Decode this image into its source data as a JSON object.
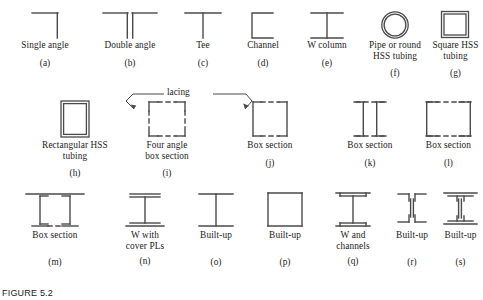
{
  "figure": {
    "caption": "FIGURE 5.2",
    "annotation": {
      "lacing_label": "lacing"
    },
    "stroke_color": "#4a4a4a",
    "text_color": "#1a1a1a"
  },
  "rows": [
    {
      "id": "row-1",
      "items": [
        {
          "tag": "(a)",
          "label": "Single angle",
          "shape": "single-angle"
        },
        {
          "tag": "(b)",
          "label": "Double angle",
          "shape": "double-angle"
        },
        {
          "tag": "(c)",
          "label": "Tee",
          "shape": "tee"
        },
        {
          "tag": "(d)",
          "label": "Channel",
          "shape": "channel"
        },
        {
          "tag": "(e)",
          "label": "W column",
          "shape": "w-column"
        },
        {
          "tag": "(f)",
          "label": "Pipe or round\nHSS tubing",
          "shape": "pipe-round-hss"
        },
        {
          "tag": "(g)",
          "label": "Square HSS\ntubing",
          "shape": "square-hss"
        }
      ]
    },
    {
      "id": "row-2",
      "items": [
        {
          "tag": "(h)",
          "label": "Rectangular HSS\ntubing",
          "shape": "rectangular-hss"
        },
        {
          "tag": "(i)",
          "label": "Four angle\nbox section",
          "shape": "four-angle-box"
        },
        {
          "tag": "(j)",
          "label": "Box section",
          "shape": "box-section-j"
        },
        {
          "tag": "(k)",
          "label": "Box section",
          "shape": "box-section-k"
        },
        {
          "tag": "(l)",
          "label": "Box section",
          "shape": "box-section-l"
        }
      ]
    },
    {
      "id": "row-3",
      "items": [
        {
          "tag": "(m)",
          "label": "Box section",
          "shape": "box-section-m"
        },
        {
          "tag": "(n)",
          "label": "W with\ncover PLs",
          "shape": "w-cover-plates"
        },
        {
          "tag": "(o)",
          "label": "Built-up",
          "shape": "built-up-o"
        },
        {
          "tag": "(p)",
          "label": "Built-up",
          "shape": "built-up-p"
        },
        {
          "tag": "(q)",
          "label": "W and\nchannels",
          "shape": "w-and-channels"
        },
        {
          "tag": "(r)",
          "label": "Built-up",
          "shape": "built-up-r"
        },
        {
          "tag": "(s)",
          "label": "Built-up",
          "shape": "built-up-s"
        }
      ]
    }
  ]
}
